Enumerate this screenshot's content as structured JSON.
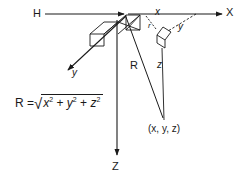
{
  "diagram": {
    "background_color": "#ffffff",
    "stroke_color": "#1a1a1a",
    "labels": {
      "horizontal_ref": "H",
      "x_axis_major": "X",
      "x_component": "x",
      "y_component": "y",
      "r_component": "r",
      "y_axis_major": "y",
      "range_label": "R",
      "z_component": "z",
      "z_axis_major": "Z",
      "point": "(x, y, z)"
    },
    "equation": {
      "lhs": "R =",
      "surd": "√",
      "term_x_base": "x",
      "term_x_exp": "2",
      "plus_1": "+",
      "term_y_base": "y",
      "term_y_exp": "2",
      "plus_2": "+",
      "term_z_base": "z",
      "term_z_exp": "2"
    }
  }
}
